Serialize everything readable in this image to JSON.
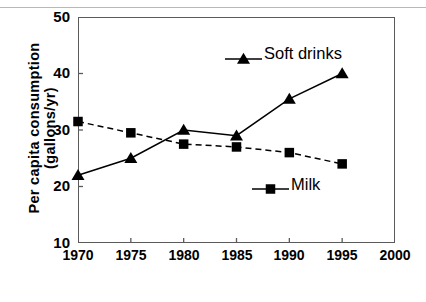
{
  "chart_data": {
    "type": "line",
    "title": "",
    "xlabel": "Year",
    "ylabel": "Per capita consumption (gallons/yr)",
    "ylabel_line1": "Per capita consumption",
    "ylabel_line2": "(gallons/yr)",
    "x": [
      1970,
      1975,
      1980,
      1985,
      1990,
      1995
    ],
    "xlim": [
      1970,
      2000
    ],
    "ylim": [
      10,
      50
    ],
    "xticks": [
      "1970",
      "1975",
      "1980",
      "1985",
      "1990",
      "1995",
      "2000"
    ],
    "yticks": [
      "10",
      "20",
      "30",
      "40",
      "50"
    ],
    "grid": false,
    "legend_position": "inside-plot",
    "series": [
      {
        "name": "Soft drinks",
        "values": [
          22,
          25,
          30,
          29,
          35.5,
          40
        ],
        "marker": "triangle",
        "linestyle": "solid",
        "color": "#000000"
      },
      {
        "name": "Milk",
        "values": [
          31.5,
          29.5,
          27.5,
          27,
          26,
          24
        ],
        "marker": "square",
        "linestyle": "dashed",
        "color": "#000000"
      }
    ]
  },
  "legend": {
    "soft_drinks": "Soft drinks",
    "milk": "Milk"
  },
  "colors": {
    "ink": "#000000",
    "frame": "#5a5a5a",
    "rule": "#b9b9b9",
    "background": "#ffffff"
  }
}
